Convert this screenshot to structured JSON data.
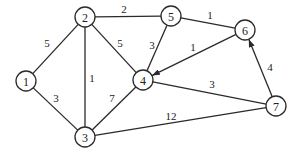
{
  "graph": {
    "nodes": [
      {
        "id": "1",
        "label": "1",
        "x": 26,
        "y": 81
      },
      {
        "id": "2",
        "label": "2",
        "x": 85,
        "y": 17
      },
      {
        "id": "3",
        "label": "3",
        "x": 85,
        "y": 137
      },
      {
        "id": "4",
        "label": "4",
        "x": 143,
        "y": 80
      },
      {
        "id": "5",
        "label": "5",
        "x": 171,
        "y": 16
      },
      {
        "id": "6",
        "label": "6",
        "x": 245,
        "y": 30
      },
      {
        "id": "7",
        "label": "7",
        "x": 276,
        "y": 106
      }
    ],
    "edges": [
      {
        "from": "1",
        "to": "2",
        "weight": "5",
        "directed": false,
        "lx": 47,
        "ly": 43
      },
      {
        "from": "1",
        "to": "3",
        "weight": "3",
        "directed": false,
        "lx": 56,
        "ly": 98
      },
      {
        "from": "2",
        "to": "3",
        "weight": "1",
        "directed": false,
        "lx": 92,
        "ly": 78
      },
      {
        "from": "2",
        "to": "4",
        "weight": "5",
        "directed": false,
        "lx": 120,
        "ly": 43
      },
      {
        "from": "2",
        "to": "5",
        "weight": "2",
        "directed": false,
        "lx": 124,
        "ly": 9
      },
      {
        "from": "3",
        "to": "4",
        "weight": "7",
        "directed": false,
        "lx": 112,
        "ly": 98
      },
      {
        "from": "3",
        "to": "7",
        "weight": "12",
        "directed": false,
        "lx": 171,
        "ly": 116
      },
      {
        "from": "5",
        "to": "4",
        "weight": "3",
        "directed": false,
        "lx": 152,
        "ly": 45
      },
      {
        "from": "5",
        "to": "6",
        "weight": "1",
        "directed": false,
        "lx": 210,
        "ly": 15
      },
      {
        "from": "6",
        "to": "4",
        "weight": "1",
        "directed": true,
        "lx": 193,
        "ly": 47
      },
      {
        "from": "7",
        "to": "6",
        "weight": "4",
        "directed": true,
        "lx": 270,
        "ly": 67
      },
      {
        "from": "4",
        "to": "7",
        "weight": "3",
        "directed": false,
        "lx": 212,
        "ly": 84
      }
    ],
    "node_radius": 10,
    "stroke_color": "#2a2a2a"
  }
}
